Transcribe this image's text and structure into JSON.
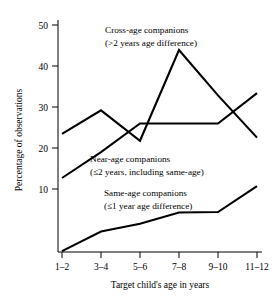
{
  "chart_data": {
    "type": "line",
    "title": "",
    "xlabel": "Target child's age in years",
    "ylabel": "Percentage of observations",
    "categories": [
      "1–2",
      "3–4",
      "5–6",
      "7–8",
      "9–10",
      "11–12"
    ],
    "ylim": [
      0,
      52
    ],
    "yticks": [
      10,
      20,
      30,
      40,
      50
    ],
    "ytick_labels": [
      "10",
      "20",
      "30",
      "40",
      "50"
    ],
    "grid": false,
    "legend_position": "inline-annotations",
    "series": [
      {
        "name": "Cross-age companions",
        "sublabel": "(>2 years age difference)",
        "values": [
          26.0,
          31.2,
          24.5,
          44.5,
          34.5,
          25.2
        ]
      },
      {
        "name": "Near-age companions",
        "sublabel": "(≤2 years, including same-age)",
        "values": [
          16.3,
          22.0,
          28.3,
          28.3,
          28.3,
          35.0
        ]
      },
      {
        "name": "Same-age companions",
        "sublabel": "(≤1 year age difference)",
        "values": [
          0.2,
          4.5,
          6.2,
          8.7,
          8.8,
          14.5
        ]
      }
    ],
    "annotations": [
      {
        "id": "cross-age",
        "line1": "Cross-age companions",
        "line2": "(>2 years age difference)"
      },
      {
        "id": "near-age",
        "line1": "Near-age companions",
        "line2": "(≤2 years, including same-age)"
      },
      {
        "id": "same-age",
        "line1": "Same-age companions",
        "line2": "(≤1 year age difference)"
      }
    ],
    "colors": {
      "line": "#000000",
      "axis": "#000000",
      "background": "#ffffff"
    }
  },
  "axis": {
    "y_label": "Percentage of observations",
    "x_label": "Target child's age in years",
    "y_ticks": [
      "50",
      "40",
      "30",
      "20",
      "10"
    ],
    "x_ticks": [
      "1–2",
      "3–4",
      "5–6",
      "7–8",
      "9–10",
      "11–12"
    ]
  }
}
